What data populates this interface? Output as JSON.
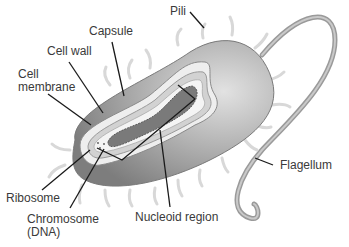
{
  "diagram": {
    "labels": {
      "pili": "Pili",
      "capsule": "Capsule",
      "cell_wall": "Cell wall",
      "cell_membrane_line1": "Cell",
      "cell_membrane_line2": "membrane",
      "flagellum": "Flagellum",
      "ribosome": "Ribosome",
      "chromosome_line1": "Chromosome",
      "chromosome_line2": "(DNA)",
      "nucleoid_region": "Nucleoid region"
    },
    "colors": {
      "background": "#ffffff",
      "cell_body": "#a8a8a8",
      "cell_shadow": "#8c8c8c",
      "capsule_layer": "#e6e6e6",
      "leader_line": "#1a1a1a",
      "label_text": "#3a3a3a",
      "dna": "#6e6e6e"
    }
  }
}
